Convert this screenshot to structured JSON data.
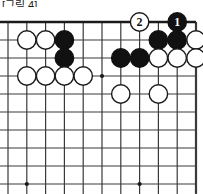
{
  "caption": {
    "text": "[그림 4]",
    "visible": "partially-cropped-top"
  },
  "board": {
    "title": "go-board-diagram",
    "game": "go",
    "visible_columns": 11,
    "visible_rows": 10,
    "shows_corner": "top-right",
    "line_color": "#3a3a3a",
    "border_color": "#1a1a1a",
    "background_color": "#ffffff",
    "black_color": "#111111",
    "white_color": "#ffffff",
    "white_outline_color": "#1a1a1a",
    "geometry": {
      "origin_x": 8,
      "origin_y": 13,
      "step_x": 18.8,
      "step_y": 18.0,
      "stone_radius": 9.2,
      "top_edge_row": 1,
      "right_edge_col": 11
    },
    "star_points": [
      {
        "col": 6,
        "row": 4
      },
      {
        "col": 2,
        "row": 10
      },
      {
        "col": 8,
        "row": 10
      }
    ],
    "stones": [
      {
        "id": "w-b2",
        "color": "white",
        "col": 2,
        "row": 2,
        "label": ""
      },
      {
        "id": "w-c2",
        "color": "white",
        "col": 3,
        "row": 2,
        "label": ""
      },
      {
        "id": "b-d2",
        "color": "black",
        "col": 4,
        "row": 2,
        "label": ""
      },
      {
        "id": "b-i2",
        "color": "black",
        "col": 9,
        "row": 2,
        "label": ""
      },
      {
        "id": "b-j2",
        "color": "black",
        "col": 10,
        "row": 2,
        "label": ""
      },
      {
        "id": "w-k2",
        "color": "white",
        "col": 11,
        "row": 2,
        "label": ""
      },
      {
        "id": "b-d3",
        "color": "black",
        "col": 4,
        "row": 3,
        "label": ""
      },
      {
        "id": "b-g3",
        "color": "black",
        "col": 7,
        "row": 3,
        "label": ""
      },
      {
        "id": "b-h3",
        "color": "black",
        "col": 8,
        "row": 3,
        "label": ""
      },
      {
        "id": "w-i3",
        "color": "white",
        "col": 9,
        "row": 3,
        "label": ""
      },
      {
        "id": "w-j3",
        "color": "white",
        "col": 10,
        "row": 3,
        "label": ""
      },
      {
        "id": "w-k3",
        "color": "white",
        "col": 11,
        "row": 3,
        "label": ""
      },
      {
        "id": "w-b4",
        "color": "white",
        "col": 2,
        "row": 4,
        "label": ""
      },
      {
        "id": "w-c4",
        "color": "white",
        "col": 3,
        "row": 4,
        "label": ""
      },
      {
        "id": "w-d4",
        "color": "white",
        "col": 4,
        "row": 4,
        "label": ""
      },
      {
        "id": "w-e4",
        "color": "white",
        "col": 5,
        "row": 4,
        "label": ""
      },
      {
        "id": "w-g5",
        "color": "white",
        "col": 7,
        "row": 5,
        "label": ""
      },
      {
        "id": "w-i5",
        "color": "white",
        "col": 9,
        "row": 5,
        "label": ""
      },
      {
        "id": "move-2",
        "color": "white",
        "col": 8,
        "row": 1,
        "label": "2"
      },
      {
        "id": "move-1",
        "color": "black",
        "col": 10,
        "row": 1,
        "label": "1"
      }
    ],
    "moves": [
      {
        "number": "1",
        "color": "black",
        "col": 10,
        "row": 1
      },
      {
        "number": "2",
        "color": "white",
        "col": 8,
        "row": 1
      }
    ]
  }
}
